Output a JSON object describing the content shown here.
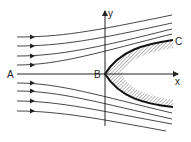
{
  "diagram": {
    "title": "",
    "type": "flow around a parabolic body (streamlines)",
    "labels": {
      "point_a": "A",
      "point_b": "B",
      "point_c": "C",
      "x_axis": "x",
      "y_axis": "y"
    },
    "colors": {
      "line": "#333333",
      "body_edge": "#111111",
      "hatch": "#888888",
      "background": "#ffffff"
    },
    "streamlines": {
      "upper_count": 4,
      "lower_count": 4,
      "arrow_direction": "right"
    },
    "body": {
      "shape": "parabola",
      "fill": "hatched",
      "stagnation_point": "B"
    }
  }
}
